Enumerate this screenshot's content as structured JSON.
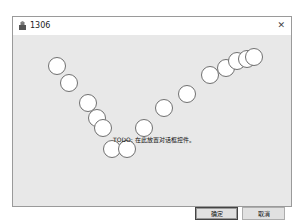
{
  "window": {
    "title": "1306",
    "icon": "app-icon",
    "close_icon": "close-icon",
    "close_glyph": "✕"
  },
  "client": {
    "todo_text": "TODO: 在此放置对话框控件。",
    "circles": [
      {
        "x": 57,
        "y": 66
      },
      {
        "x": 69,
        "y": 83
      },
      {
        "x": 88,
        "y": 103
      },
      {
        "x": 97,
        "y": 118
      },
      {
        "x": 103,
        "y": 128
      },
      {
        "x": 112,
        "y": 149
      },
      {
        "x": 127,
        "y": 149
      },
      {
        "x": 144,
        "y": 128
      },
      {
        "x": 164,
        "y": 108
      },
      {
        "x": 187,
        "y": 94
      },
      {
        "x": 210,
        "y": 75
      },
      {
        "x": 226,
        "y": 68
      },
      {
        "x": 237,
        "y": 61
      },
      {
        "x": 247,
        "y": 59
      },
      {
        "x": 254,
        "y": 57
      }
    ],
    "circle_radius": 9
  },
  "buttons": {
    "ok_label": "确定",
    "cancel_label": "取消"
  }
}
